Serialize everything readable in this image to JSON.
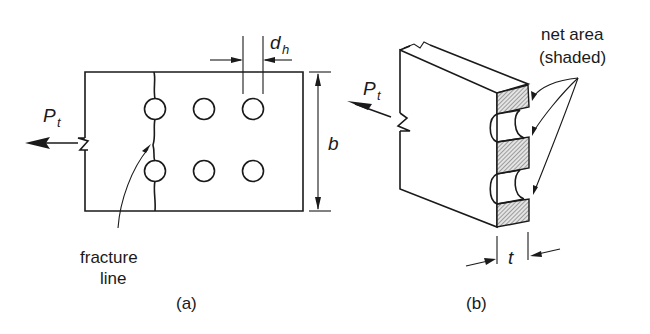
{
  "figure": {
    "panel_a": {
      "caption": "(a)",
      "force_label": "P",
      "force_subscript": "t",
      "hole_diameter_label": "d",
      "hole_diameter_subscript": "h",
      "width_label": "b",
      "fracture_label_line1": "fracture",
      "fracture_label_line2": "line",
      "holes": {
        "rows": 2,
        "columns": 3
      }
    },
    "panel_b": {
      "caption": "(b)",
      "force_label": "P",
      "force_subscript": "t",
      "thickness_label": "t",
      "net_area_label_line1": "net area",
      "net_area_label_line2": "(shaded)"
    },
    "colors": {
      "line": "#1a1a1a",
      "background": "#ffffff",
      "hatch": "#555555"
    }
  }
}
